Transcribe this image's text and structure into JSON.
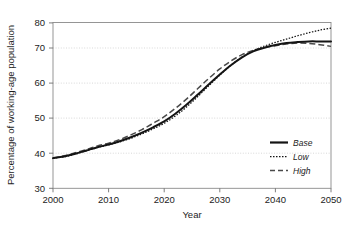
{
  "chart_data": {
    "type": "line",
    "title": "",
    "xlabel": "Year",
    "ylabel": "Percentage of working-age population",
    "xlim": [
      2000,
      2050
    ],
    "ylim": [
      30,
      80
    ],
    "xticks": [
      "2000",
      "2010",
      "2020",
      "2030",
      "2040",
      "2050"
    ],
    "yticks": [
      "30",
      "40",
      "50",
      "60",
      "70",
      "80"
    ],
    "grid": true,
    "legend_position": "lower-right",
    "x": [
      2000,
      2002,
      2004,
      2006,
      2008,
      2010,
      2012,
      2014,
      2016,
      2018,
      2020,
      2022,
      2024,
      2026,
      2028,
      2030,
      2032,
      2034,
      2036,
      2038,
      2040,
      2042,
      2044,
      2046,
      2048,
      2050
    ],
    "series": [
      {
        "name": "Base",
        "style": "solid",
        "color": "#141414",
        "values": [
          39.1,
          39.6,
          40.4,
          41.4,
          42.4,
          43.2,
          44.2,
          45.4,
          46.8,
          48.4,
          50.2,
          52.5,
          55.2,
          58.2,
          61.3,
          64.3,
          67.1,
          69.5,
          71.3,
          72.4,
          73.2,
          73.8,
          74.1,
          74.3,
          74.3,
          74.3
        ]
      },
      {
        "name": "Low",
        "style": "dotted",
        "color": "#141414",
        "values": [
          39.1,
          39.5,
          40.3,
          41.3,
          42.3,
          43.1,
          44.0,
          45.1,
          46.4,
          47.9,
          49.6,
          51.8,
          54.5,
          57.6,
          60.9,
          64.1,
          67.1,
          69.6,
          71.5,
          72.9,
          74.0,
          75.0,
          76.0,
          76.9,
          77.7,
          78.3
        ]
      },
      {
        "name": "High",
        "style": "dashed",
        "color": "#4a4a4a",
        "values": [
          39.1,
          39.8,
          40.7,
          41.7,
          42.8,
          43.6,
          44.7,
          46.1,
          47.7,
          49.6,
          51.6,
          54.1,
          56.9,
          60.0,
          63.1,
          66.0,
          68.4,
          70.3,
          71.6,
          72.4,
          73.0,
          73.5,
          73.8,
          73.7,
          73.3,
          72.8
        ]
      }
    ]
  },
  "legend": {
    "items": [
      {
        "label": "Base"
      },
      {
        "label": "Low"
      },
      {
        "label": "High"
      }
    ]
  }
}
